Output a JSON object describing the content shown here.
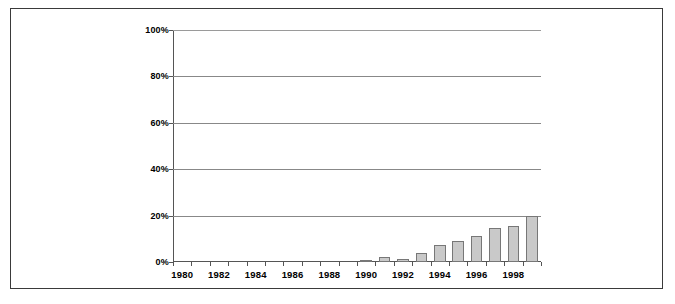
{
  "chart_data": {
    "type": "bar",
    "title": "",
    "subtitle": "",
    "xlabel": "",
    "ylabel": "",
    "categories": [
      "1980",
      "1981",
      "1982",
      "1983",
      "1984",
      "1985",
      "1986",
      "1987",
      "1988",
      "1989",
      "1990",
      "1991",
      "1992",
      "1993",
      "1994",
      "1995",
      "1996",
      "1997",
      "1998",
      "1999"
    ],
    "values": [
      0,
      0,
      0,
      0,
      0,
      0,
      0,
      0,
      0,
      0,
      1,
      2,
      1.5,
      4,
      7.5,
      9,
      11,
      14.5,
      15.5,
      20
    ],
    "ylim": [
      0,
      100
    ],
    "ytick_labels": [
      "0%",
      "20%",
      "40%",
      "60%",
      "80%",
      "100%"
    ],
    "ytick_values": [
      0,
      20,
      40,
      60,
      80,
      100
    ],
    "xtick_labels": [
      "1980",
      "1982",
      "1984",
      "1986",
      "1988",
      "1990",
      "1992",
      "1994",
      "1996",
      "1998"
    ],
    "xtick_values": [
      "1980",
      "1982",
      "1984",
      "1986",
      "1988",
      "1990",
      "1992",
      "1994",
      "1996",
      "1998"
    ],
    "grid": true,
    "legend": false,
    "legend_position": "none",
    "bar_color": "#c9c9c9",
    "bar_border_color": "#777777",
    "gridline_color": "#888888",
    "axis_color": "#555555",
    "frame_color": "#3a3a3a",
    "background_color": "#ffffff"
  }
}
